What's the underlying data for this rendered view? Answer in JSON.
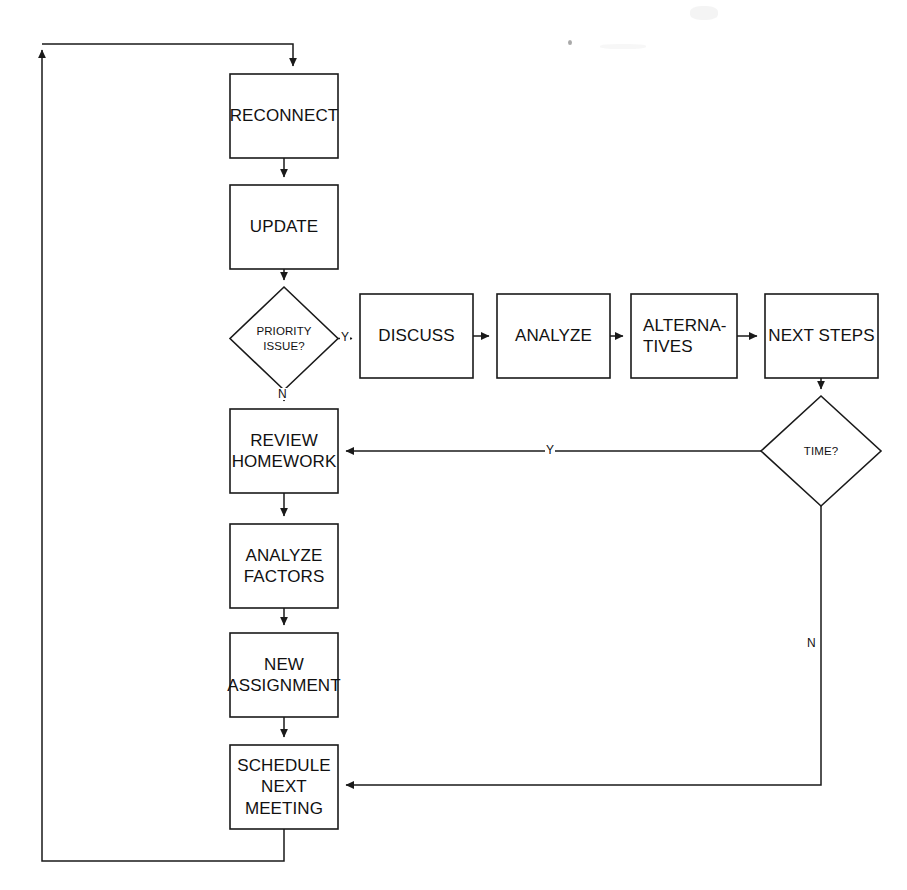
{
  "diagram": {
    "type": "flowchart",
    "canvas": {
      "width": 907,
      "height": 890
    },
    "stroke_color": "#1a1a1a",
    "fill_color": "#ffffff",
    "text_color": "#111111"
  },
  "nodes": [
    {
      "id": "reconnect",
      "shape": "process",
      "label": "RECONNECT",
      "x": 230,
      "y": 74,
      "w": 108,
      "h": 84
    },
    {
      "id": "update",
      "shape": "process",
      "label": "UPDATE",
      "x": 230,
      "y": 185,
      "w": 108,
      "h": 84
    },
    {
      "id": "priority_issue",
      "shape": "decision",
      "label": "PRIORITY\nISSUE?",
      "x": 230,
      "y": 287,
      "w": 108,
      "h": 103
    },
    {
      "id": "discuss",
      "shape": "process",
      "label": "DISCUSS",
      "x": 360,
      "y": 294,
      "w": 113,
      "h": 84
    },
    {
      "id": "analyze",
      "shape": "process",
      "label": "ANALYZE",
      "x": 497,
      "y": 294,
      "w": 113,
      "h": 84
    },
    {
      "id": "alternatives",
      "shape": "process",
      "label": "ALTERNA-\nTIVES",
      "x": 631,
      "y": 294,
      "w": 106,
      "h": 84
    },
    {
      "id": "next_steps",
      "shape": "process",
      "label": "NEXT STEPS",
      "x": 765,
      "y": 294,
      "w": 113,
      "h": 84
    },
    {
      "id": "time",
      "shape": "decision",
      "label": "TIME?",
      "x": 761,
      "y": 396,
      "w": 120,
      "h": 110
    },
    {
      "id": "review_homework",
      "shape": "process",
      "label": "REVIEW\nHOMEWORK",
      "x": 230,
      "y": 409,
      "w": 108,
      "h": 84
    },
    {
      "id": "analyze_factors",
      "shape": "process",
      "label": "ANALYZE\nFACTORS",
      "x": 230,
      "y": 524,
      "w": 108,
      "h": 84
    },
    {
      "id": "new_assignment",
      "shape": "process",
      "label": "NEW\nASSIGNMENT",
      "x": 230,
      "y": 633,
      "w": 108,
      "h": 84
    },
    {
      "id": "schedule_next_meeting",
      "shape": "process",
      "label": "SCHEDULE\nNEXT\nMEETING",
      "x": 230,
      "y": 745,
      "w": 108,
      "h": 84
    }
  ],
  "edges": [
    {
      "id": "e-loop-to-reconnect",
      "from": "loop-top",
      "to": "reconnect",
      "label": ""
    },
    {
      "id": "e-reconnect-update",
      "from": "reconnect",
      "to": "update",
      "label": ""
    },
    {
      "id": "e-update-priority",
      "from": "update",
      "to": "priority_issue",
      "label": ""
    },
    {
      "id": "e-priority-discuss",
      "from": "priority_issue",
      "to": "discuss",
      "label": "Y"
    },
    {
      "id": "e-priority-review",
      "from": "priority_issue",
      "to": "review_homework",
      "label": "N"
    },
    {
      "id": "e-discuss-analyze",
      "from": "discuss",
      "to": "analyze",
      "label": ""
    },
    {
      "id": "e-analyze-alternatives",
      "from": "analyze",
      "to": "alternatives",
      "label": ""
    },
    {
      "id": "e-alternatives-next",
      "from": "alternatives",
      "to": "next_steps",
      "label": ""
    },
    {
      "id": "e-next-time",
      "from": "next_steps",
      "to": "time",
      "label": ""
    },
    {
      "id": "e-time-review",
      "from": "time",
      "to": "review_homework",
      "label": "Y"
    },
    {
      "id": "e-time-schedule",
      "from": "time",
      "to": "schedule_next_meeting",
      "label": "N"
    },
    {
      "id": "e-review-factors",
      "from": "review_homework",
      "to": "analyze_factors",
      "label": ""
    },
    {
      "id": "e-factors-assignment",
      "from": "analyze_factors",
      "to": "new_assignment",
      "label": ""
    },
    {
      "id": "e-assignment-schedule",
      "from": "new_assignment",
      "to": "schedule_next_meeting",
      "label": ""
    },
    {
      "id": "e-schedule-loop",
      "from": "schedule_next_meeting",
      "to": "reconnect",
      "label": ""
    }
  ],
  "edge_labels": [
    {
      "id": "label-priority-yes",
      "text": "Y",
      "x": 344,
      "y": 331
    },
    {
      "id": "label-priority-no",
      "text": "N",
      "x": 277,
      "y": 390
    },
    {
      "id": "label-time-yes",
      "text": "Y",
      "x": 545,
      "y": 436
    },
    {
      "id": "label-time-no",
      "text": "N",
      "x": 812,
      "y": 634
    }
  ],
  "artifacts": [
    {
      "id": "scan-speck",
      "x": 568,
      "y": 40
    }
  ]
}
